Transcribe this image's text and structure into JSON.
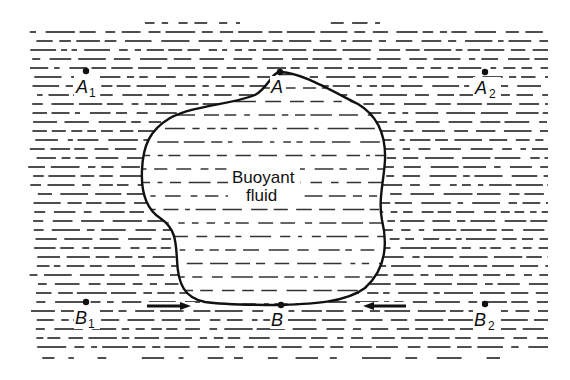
{
  "figure": {
    "background_pattern": "horizontal-dashed-lines",
    "colors": {
      "ink": "#111111",
      "background": "#ffffff"
    }
  },
  "blob": {
    "label_line1": "Buoyant",
    "label_line2": "fluid"
  },
  "points": {
    "A": {
      "letter": "A",
      "sub": "",
      "x": 280,
      "y": 72
    },
    "A1": {
      "letter": "A",
      "sub": "1",
      "x": 86,
      "y": 71
    },
    "A2": {
      "letter": "A",
      "sub": "2",
      "x": 485,
      "y": 72
    },
    "B": {
      "letter": "B",
      "sub": "",
      "x": 281,
      "y": 305
    },
    "B1": {
      "letter": "B",
      "sub": "1",
      "x": 86,
      "y": 302
    },
    "B2": {
      "letter": "B",
      "sub": "2",
      "x": 485,
      "y": 304
    }
  },
  "arrows": [
    {
      "name": "left-arrow",
      "direction": "right",
      "from": [
        147,
        306
      ],
      "to": [
        190,
        306
      ]
    },
    {
      "name": "right-arrow",
      "direction": "left",
      "from": [
        405,
        306
      ],
      "to": [
        363,
        306
      ]
    }
  ]
}
